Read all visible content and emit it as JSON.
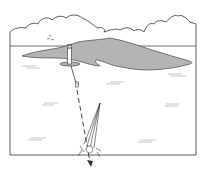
{
  "figure": {
    "elements": [
      {
        "id": "sky-clouds",
        "kind": "cloud-outline"
      },
      {
        "id": "horizon",
        "kind": "line"
      },
      {
        "id": "island",
        "kind": "landmass",
        "fill": "#b4b4b4"
      },
      {
        "id": "birds",
        "kind": "birds"
      },
      {
        "id": "lighthouse",
        "kind": "lighthouse"
      },
      {
        "id": "buoy",
        "kind": "buoy"
      },
      {
        "id": "course-line",
        "kind": "dashed-arrow"
      },
      {
        "id": "sailboat",
        "kind": "sailboat"
      },
      {
        "id": "water-ripples",
        "kind": "ripples",
        "count": 6
      }
    ]
  },
  "colors": {
    "line": "#333333",
    "island_fill": "#b4b4b4",
    "background": "#ffffff"
  }
}
